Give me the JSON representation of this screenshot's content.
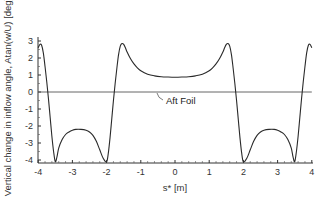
{
  "chart_data": {
    "type": "line",
    "title": "",
    "xlabel": "s* [m]",
    "ylabel": "Vertical change in inflow angle, Atan(w/U) [deg]",
    "xlim": [
      -4,
      4
    ],
    "ylim": [
      -4.2,
      3.2
    ],
    "xticks": [
      -4,
      -3,
      -2,
      -1,
      0,
      1,
      2,
      3,
      4
    ],
    "yticks": [
      3,
      2,
      1,
      0,
      -1,
      -2,
      -3,
      -4
    ],
    "grid": false,
    "legend": null,
    "annotations": [
      {
        "text": "Aft Foil",
        "points_to": {
          "x": -0.5,
          "y": 0
        }
      }
    ],
    "series": [
      {
        "name": "Aft Foil",
        "description": "horizontal reference line at zero",
        "x": [
          -4,
          4
        ],
        "y": [
          0,
          0
        ]
      },
      {
        "name": "Inflow angle change",
        "x": [
          -4.0,
          -3.95,
          -3.9,
          -3.85,
          -3.8,
          -3.75,
          -3.7,
          -3.65,
          -3.6,
          -3.55,
          -3.5,
          -3.45,
          -3.4,
          -3.3,
          -3.2,
          -3.1,
          -3.0,
          -2.9,
          -2.75,
          -2.6,
          -2.5,
          -2.4,
          -2.3,
          -2.2,
          -2.1,
          -2.0,
          -1.95,
          -1.9,
          -1.85,
          -1.8,
          -1.75,
          -1.7,
          -1.65,
          -1.6,
          -1.55,
          -1.5,
          -1.45,
          -1.4,
          -1.3,
          -1.2,
          -1.1,
          -1.0,
          -0.8,
          -0.6,
          -0.4,
          -0.2,
          0.0,
          0.2,
          0.4,
          0.6,
          0.8,
          1.0,
          1.1,
          1.2,
          1.3,
          1.4,
          1.45,
          1.5,
          1.55,
          1.6,
          1.65,
          1.7,
          1.75,
          1.8,
          1.85,
          1.9,
          1.95,
          2.0,
          2.1,
          2.2,
          2.3,
          2.4,
          2.5,
          2.6,
          2.75,
          2.9,
          3.0,
          3.1,
          3.2,
          3.3,
          3.4,
          3.45,
          3.5,
          3.55,
          3.6,
          3.65,
          3.7,
          3.75,
          3.8,
          3.85,
          3.9,
          3.95,
          4.0
        ],
        "y": [
          2.6,
          2.8,
          2.75,
          2.3,
          1.5,
          0.6,
          -0.4,
          -1.5,
          -2.6,
          -3.5,
          -4.1,
          -3.8,
          -3.3,
          -2.8,
          -2.5,
          -2.35,
          -2.25,
          -2.2,
          -2.2,
          -2.25,
          -2.35,
          -2.55,
          -2.9,
          -3.4,
          -3.9,
          -4.1,
          -3.6,
          -2.7,
          -1.6,
          -0.5,
          0.5,
          1.4,
          2.2,
          2.7,
          2.85,
          2.8,
          2.6,
          2.35,
          1.95,
          1.65,
          1.42,
          1.25,
          1.05,
          0.95,
          0.9,
          0.88,
          0.87,
          0.88,
          0.9,
          0.95,
          1.05,
          1.25,
          1.42,
          1.65,
          1.95,
          2.35,
          2.6,
          2.8,
          2.85,
          2.7,
          2.2,
          1.4,
          0.5,
          -0.5,
          -1.6,
          -2.7,
          -3.6,
          -4.1,
          -3.9,
          -3.4,
          -2.9,
          -2.55,
          -2.35,
          -2.25,
          -2.2,
          -2.2,
          -2.25,
          -2.35,
          -2.5,
          -2.8,
          -3.3,
          -3.8,
          -4.1,
          -3.5,
          -2.6,
          -1.5,
          -0.4,
          0.6,
          1.5,
          2.3,
          2.75,
          2.8,
          2.6
        ]
      }
    ],
    "colors": {
      "curve": "#2a2a2a",
      "zero_line": "#555555",
      "axis": "#333333"
    }
  }
}
